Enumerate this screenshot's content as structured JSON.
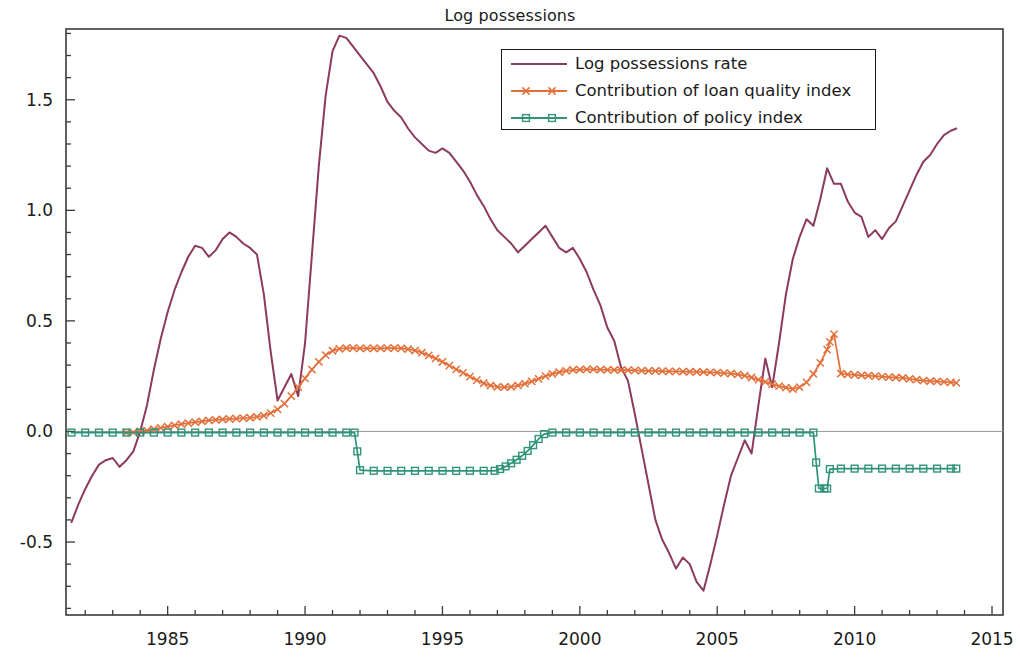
{
  "figure": {
    "title": "Log possessions",
    "background": "#ffffff"
  },
  "legend": {
    "position": "upper-center-right",
    "border_color": "#1a1a1a",
    "entries": [
      {
        "label": "Log possessions rate",
        "color": "#8c3a5e",
        "marker": "none"
      },
      {
        "label": "Contribution of loan quality index",
        "color": "#e3703a",
        "marker": "x"
      },
      {
        "label": "Contribution of policy index",
        "color": "#2f9479",
        "marker": "square"
      }
    ]
  },
  "axes": {
    "x": {
      "label": "",
      "ticks": [
        "1985",
        "1990",
        "1995",
        "2000",
        "2005",
        "2010",
        "2015"
      ],
      "tick_values": [
        1985,
        1990,
        1995,
        2000,
        2005,
        2010,
        2015
      ],
      "minor_tick_step": 1,
      "range": [
        1981.3,
        2015.4
      ]
    },
    "y": {
      "label": "",
      "ticks": [
        "-0.5",
        "0.0",
        "0.5",
        "1.0",
        "1.5"
      ],
      "tick_values": [
        -0.5,
        0.0,
        0.5,
        1.0,
        1.5
      ],
      "minor_tick_step": 0.1,
      "range": [
        -0.83,
        1.82
      ]
    },
    "zero_line": true,
    "grid": false
  },
  "chart_data": {
    "type": "line",
    "title": "Log possessions",
    "xlabel": "",
    "ylabel": "",
    "xlim": [
      1981.3,
      2015.4
    ],
    "ylim": [
      -0.83,
      1.82
    ],
    "grid": false,
    "legend_position": "upper center",
    "series": [
      {
        "name": "Log possessions rate",
        "color": "#8c3a5e",
        "marker": "none",
        "x": [
          1981.5,
          1981.75,
          1982.0,
          1982.25,
          1982.5,
          1982.75,
          1983.0,
          1983.25,
          1983.5,
          1983.75,
          1984.0,
          1984.25,
          1984.5,
          1984.75,
          1985.0,
          1985.25,
          1985.5,
          1985.75,
          1986.0,
          1986.25,
          1986.5,
          1986.75,
          1987.0,
          1987.25,
          1987.5,
          1987.75,
          1988.0,
          1988.25,
          1988.5,
          1988.75,
          1989.0,
          1989.25,
          1989.5,
          1989.75,
          1990.0,
          1990.25,
          1990.5,
          1990.75,
          1991.0,
          1991.25,
          1991.5,
          1991.75,
          1992.0,
          1992.25,
          1992.5,
          1992.75,
          1993.0,
          1993.25,
          1993.5,
          1993.75,
          1994.0,
          1994.25,
          1994.5,
          1994.75,
          1995.0,
          1995.25,
          1995.5,
          1995.75,
          1996.0,
          1996.25,
          1996.5,
          1996.75,
          1997.0,
          1997.25,
          1997.5,
          1997.75,
          1998.0,
          1998.25,
          1998.5,
          1998.75,
          1999.0,
          1999.25,
          1999.5,
          1999.75,
          2000.0,
          2000.25,
          2000.5,
          2000.75,
          2001.0,
          2001.25,
          2001.5,
          2001.75,
          2002.0,
          2002.25,
          2002.5,
          2002.75,
          2003.0,
          2003.25,
          2003.5,
          2003.75,
          2004.0,
          2004.25,
          2004.5,
          2004.75,
          2005.0,
          2005.25,
          2005.5,
          2005.75,
          2006.0,
          2006.25,
          2006.5,
          2006.75,
          2007.0,
          2007.25,
          2007.5,
          2007.75,
          2008.0,
          2008.25,
          2008.5,
          2008.75,
          2009.0,
          2009.25,
          2009.5,
          2009.75,
          2010.0,
          2010.25,
          2010.5,
          2010.75,
          2011.0,
          2011.25,
          2011.5,
          2011.75,
          2012.0,
          2012.25,
          2012.5,
          2012.75,
          2013.0,
          2013.25,
          2013.5,
          2013.7
        ],
        "y": [
          -0.41,
          -0.33,
          -0.26,
          -0.2,
          -0.15,
          -0.13,
          -0.12,
          -0.16,
          -0.13,
          -0.09,
          0.0,
          0.12,
          0.28,
          0.42,
          0.54,
          0.64,
          0.72,
          0.79,
          0.84,
          0.83,
          0.79,
          0.82,
          0.87,
          0.9,
          0.88,
          0.85,
          0.83,
          0.8,
          0.62,
          0.36,
          0.14,
          0.2,
          0.26,
          0.16,
          0.4,
          0.8,
          1.2,
          1.52,
          1.72,
          1.79,
          1.78,
          1.74,
          1.7,
          1.66,
          1.62,
          1.56,
          1.49,
          1.45,
          1.42,
          1.37,
          1.33,
          1.3,
          1.27,
          1.26,
          1.28,
          1.26,
          1.22,
          1.18,
          1.13,
          1.07,
          1.02,
          0.96,
          0.91,
          0.88,
          0.85,
          0.81,
          0.84,
          0.87,
          0.9,
          0.93,
          0.88,
          0.83,
          0.81,
          0.83,
          0.78,
          0.72,
          0.64,
          0.57,
          0.47,
          0.41,
          0.29,
          0.23,
          0.08,
          -0.08,
          -0.24,
          -0.4,
          -0.49,
          -0.55,
          -0.62,
          -0.57,
          -0.6,
          -0.68,
          -0.72,
          -0.6,
          -0.47,
          -0.33,
          -0.2,
          -0.12,
          -0.04,
          -0.1,
          0.12,
          0.33,
          0.2,
          0.4,
          0.62,
          0.78,
          0.88,
          0.96,
          0.93,
          1.05,
          1.19,
          1.12,
          1.12,
          1.04,
          0.99,
          0.97,
          0.88,
          0.91,
          0.87,
          0.92,
          0.95,
          1.02,
          1.09,
          1.16,
          1.22,
          1.25,
          1.3,
          1.34,
          1.36,
          1.37
        ]
      },
      {
        "name": "Contribution of loan quality index",
        "color": "#e3703a",
        "marker": "x",
        "x": [
          1983.5,
          1983.75,
          1984.0,
          1984.25,
          1984.5,
          1984.75,
          1985.0,
          1985.25,
          1985.5,
          1985.75,
          1986.0,
          1986.25,
          1986.5,
          1986.75,
          1987.0,
          1987.25,
          1987.5,
          1987.75,
          1988.0,
          1988.25,
          1988.5,
          1988.75,
          1989.0,
          1989.25,
          1989.5,
          1989.75,
          1990.0,
          1990.25,
          1990.5,
          1990.75,
          1991.0,
          1991.25,
          1991.5,
          1991.75,
          1992.0,
          1992.25,
          1992.5,
          1992.75,
          1993.0,
          1993.25,
          1993.5,
          1993.75,
          1994.0,
          1994.25,
          1994.5,
          1994.75,
          1995.0,
          1995.25,
          1995.5,
          1995.75,
          1996.0,
          1996.25,
          1996.5,
          1996.75,
          1997.0,
          1997.25,
          1997.5,
          1997.75,
          1998.0,
          1998.25,
          1998.5,
          1998.75,
          1999.0,
          1999.25,
          1999.5,
          1999.75,
          2000.0,
          2000.25,
          2000.5,
          2000.75,
          2001.0,
          2001.25,
          2001.5,
          2001.75,
          2002.0,
          2002.25,
          2002.5,
          2002.75,
          2003.0,
          2003.25,
          2003.5,
          2003.75,
          2004.0,
          2004.25,
          2004.5,
          2004.75,
          2005.0,
          2005.25,
          2005.5,
          2005.75,
          2006.0,
          2006.25,
          2006.5,
          2006.75,
          2007.0,
          2007.25,
          2007.5,
          2007.75,
          2008.0,
          2008.25,
          2008.5,
          2008.75,
          2009.0,
          2009.1,
          2009.25,
          2009.5,
          2009.75,
          2010.0,
          2010.25,
          2010.5,
          2010.75,
          2011.0,
          2011.25,
          2011.5,
          2011.75,
          2012.0,
          2012.25,
          2012.5,
          2012.75,
          2013.0,
          2013.25,
          2013.5,
          2013.7
        ],
        "y": [
          -0.005,
          -0.004,
          0.0,
          0.004,
          0.01,
          0.016,
          0.022,
          0.028,
          0.033,
          0.038,
          0.042,
          0.046,
          0.05,
          0.052,
          0.055,
          0.057,
          0.058,
          0.06,
          0.062,
          0.066,
          0.072,
          0.083,
          0.1,
          0.126,
          0.16,
          0.2,
          0.24,
          0.28,
          0.315,
          0.345,
          0.365,
          0.374,
          0.377,
          0.377,
          0.376,
          0.376,
          0.376,
          0.376,
          0.377,
          0.377,
          0.376,
          0.372,
          0.366,
          0.356,
          0.344,
          0.33,
          0.315,
          0.298,
          0.281,
          0.265,
          0.248,
          0.232,
          0.218,
          0.208,
          0.202,
          0.2,
          0.202,
          0.208,
          0.216,
          0.226,
          0.238,
          0.25,
          0.26,
          0.268,
          0.274,
          0.278,
          0.28,
          0.281,
          0.281,
          0.28,
          0.279,
          0.278,
          0.277,
          0.277,
          0.276,
          0.275,
          0.274,
          0.274,
          0.273,
          0.272,
          0.272,
          0.271,
          0.27,
          0.269,
          0.268,
          0.267,
          0.266,
          0.264,
          0.262,
          0.258,
          0.252,
          0.244,
          0.234,
          0.224,
          0.214,
          0.205,
          0.198,
          0.192,
          0.2,
          0.222,
          0.26,
          0.31,
          0.37,
          0.405,
          0.44,
          0.262,
          0.258,
          0.256,
          0.254,
          0.252,
          0.25,
          0.248,
          0.246,
          0.244,
          0.242,
          0.238,
          0.234,
          0.23,
          0.228,
          0.226,
          0.224,
          0.222,
          0.22
        ]
      },
      {
        "name": "Contribution of policy index",
        "color": "#2f9479",
        "marker": "square",
        "x": [
          1981.5,
          1982.0,
          1982.5,
          1983.0,
          1983.5,
          1984.0,
          1984.5,
          1985.0,
          1985.5,
          1986.0,
          1986.5,
          1987.0,
          1987.5,
          1988.0,
          1988.5,
          1989.0,
          1989.5,
          1990.0,
          1990.5,
          1991.0,
          1991.5,
          1991.8,
          1991.9,
          1992.0,
          1992.5,
          1993.0,
          1993.5,
          1994.0,
          1994.5,
          1995.0,
          1995.5,
          1996.0,
          1996.5,
          1996.9,
          1997.1,
          1997.3,
          1997.5,
          1997.7,
          1997.9,
          1998.1,
          1998.3,
          1998.5,
          1998.7,
          1999.0,
          1999.5,
          2000.0,
          2000.5,
          2001.0,
          2001.5,
          2002.0,
          2002.5,
          2003.0,
          2003.5,
          2004.0,
          2004.5,
          2005.0,
          2005.5,
          2006.0,
          2006.5,
          2007.0,
          2007.5,
          2008.0,
          2008.5,
          2008.6,
          2008.7,
          2008.9,
          2009.0,
          2009.1,
          2009.5,
          2010.0,
          2010.5,
          2011.0,
          2011.5,
          2012.0,
          2012.5,
          2013.0,
          2013.5,
          2013.7
        ],
        "y": [
          -0.005,
          -0.005,
          -0.005,
          -0.005,
          -0.005,
          -0.005,
          -0.005,
          -0.005,
          -0.005,
          -0.005,
          -0.005,
          -0.005,
          -0.005,
          -0.005,
          -0.005,
          -0.005,
          -0.005,
          -0.005,
          -0.005,
          -0.005,
          -0.005,
          -0.005,
          -0.09,
          -0.175,
          -0.178,
          -0.178,
          -0.178,
          -0.178,
          -0.178,
          -0.178,
          -0.178,
          -0.178,
          -0.178,
          -0.178,
          -0.17,
          -0.158,
          -0.144,
          -0.128,
          -0.11,
          -0.088,
          -0.062,
          -0.034,
          -0.012,
          -0.005,
          -0.005,
          -0.005,
          -0.005,
          -0.005,
          -0.005,
          -0.005,
          -0.005,
          -0.005,
          -0.005,
          -0.005,
          -0.005,
          -0.005,
          -0.005,
          -0.005,
          -0.005,
          -0.005,
          -0.005,
          -0.005,
          -0.005,
          -0.14,
          -0.258,
          -0.258,
          -0.258,
          -0.17,
          -0.168,
          -0.168,
          -0.168,
          -0.168,
          -0.168,
          -0.168,
          -0.168,
          -0.168,
          -0.168,
          -0.168
        ]
      }
    ]
  }
}
